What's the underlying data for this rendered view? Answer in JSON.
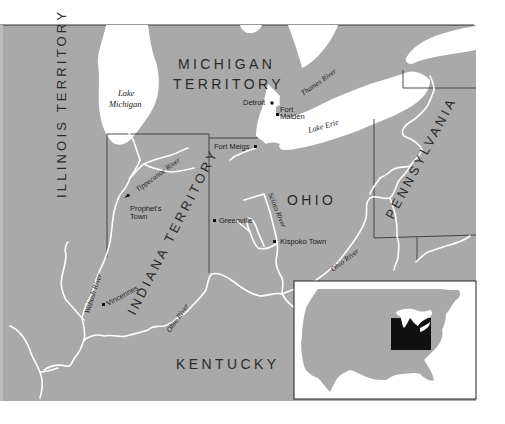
{
  "colors": {
    "land": "#a9a9a9",
    "water": "#ffffff",
    "border": "#3a3a3a",
    "inset_highlight": "#111111",
    "page_background": "#ffffff"
  },
  "regions": {
    "michigan_line1": "MICHIGAN",
    "michigan_line2": "TERRITORY",
    "illinois": "ILLINOIS TERRITORY",
    "indiana": "INDIANA TERRITORY",
    "ohio": "OHIO",
    "pennsylvania": "PENNSYLVANIA",
    "kentucky": "KENTUCKY"
  },
  "lakes": {
    "michigan_line1": "Lake",
    "michigan_line2": "Michigan",
    "erie": "Lake Erie"
  },
  "rivers": {
    "thames": "Thames River",
    "tippecanoe": "Tippecanoe River",
    "wabash": "Wabash River",
    "ohio_west": "Ohio River",
    "ohio_east": "Ohio River",
    "scioto": "Scioto River"
  },
  "places": {
    "detroit": "Detroit",
    "fort_malden_line1": "Fort",
    "fort_malden_line2": "Malden",
    "fort_meigs": "Fort Meigs",
    "prophets_town_line1": "Prophet's",
    "prophets_town_line2": "Town",
    "greenville": "Greenville",
    "kispoko_town": "Kispoko Town",
    "vincennes": "Vincennes"
  },
  "inset": {
    "description": "United States locator map with highlighted region"
  }
}
